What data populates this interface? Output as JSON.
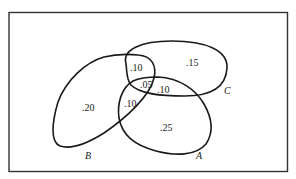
{
  "diagram": {
    "type": "venn",
    "sets": [
      {
        "name": "A",
        "label": "A"
      },
      {
        "name": "B",
        "label": "B"
      },
      {
        "name": "C",
        "label": "C"
      }
    ],
    "regions": {
      "B_only": ".20",
      "B_C_only": ".10",
      "A_B_C": ".05",
      "A_C_only": ".10",
      "A_B_only": ".10",
      "C_only": ".15",
      "A_only": ".25"
    },
    "colors": {
      "stroke": "#1a1a1a",
      "background": "#ffffff"
    }
  }
}
